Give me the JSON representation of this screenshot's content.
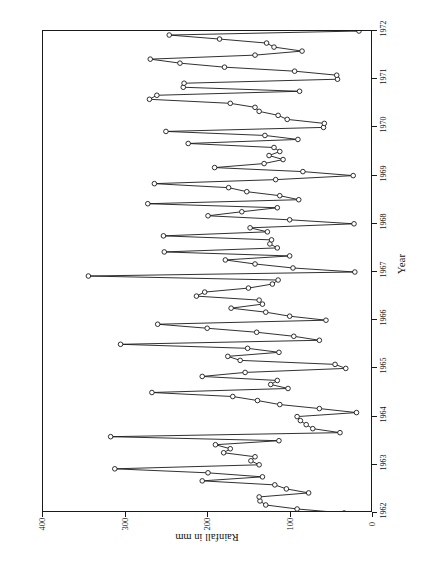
{
  "title": "Rainfall in Fort Portal : 1962 – 1971",
  "axes": {
    "value_axis_title": "Rainfall in mm",
    "category_axis_title": "Year"
  },
  "chart_data": {
    "type": "line",
    "title": "Rainfall in Fort Portal : 1962 – 1971",
    "orientation": "rotated-90-clockwise",
    "xlabel": "Year",
    "ylabel": "Rainfall in mm",
    "xlim": [
      1962,
      1972
    ],
    "ylim": [
      0,
      400
    ],
    "x_ticks": [
      1962,
      1963,
      1964,
      1965,
      1966,
      1967,
      1968,
      1969,
      1970,
      1971,
      1972
    ],
    "x_tick_labels": [
      "1962",
      "1963",
      "1964",
      "1965",
      "1966",
      "1967",
      "1968",
      "1969",
      "1970",
      "1971",
      "1972"
    ],
    "y_ticks": [
      0,
      100,
      200,
      300,
      400
    ],
    "y_tick_labels": [
      "0",
      "100",
      "200",
      "300",
      "400"
    ],
    "y_axis_reversed_in_render": true,
    "grid": false,
    "legend": false,
    "marker": "open-circle",
    "series": [
      {
        "name": "Monthly rainfall",
        "x_start": 1962.0,
        "x_step": 0.08333,
        "units": "mm",
        "values": [
          35,
          92,
          130,
          137,
          138,
          78,
          105,
          119,
          207,
          134,
          200,
          313,
          138,
          148,
          143,
          181,
          173,
          191,
          114,
          318,
          40,
          73,
          81,
          88,
          92,
          20,
          65,
          113,
          140,
          170,
          268,
          103,
          124,
          116,
          207,
          155,
          33,
          46,
          161,
          176,
          114,
          152,
          306,
          65,
          96,
          141,
          201,
          261,
          57,
          101,
          130,
          172,
          134,
          138,
          214,
          204,
          151,
          122,
          115,
          345,
          22,
          97,
          143,
          179,
          101,
          253,
          116,
          125,
          123,
          254,
          128,
          149,
          23,
          101,
          200,
          159,
          116,
          273,
          90,
          113,
          153,
          175,
          265,
          118,
          24,
          85,
          192,
          132,
          109,
          126,
          113,
          120,
          224,
          91,
          131,
          251,
          60,
          59,
          104,
          115,
          138,
          143,
          173,
          271,
          262,
          89,
          230,
          229,
          43,
          44,
          95,
          180,
          234,
          270,
          143,
          86,
          120,
          129,
          186,
          247,
          17,
          90,
          121,
          144,
          185
        ]
      }
    ]
  }
}
